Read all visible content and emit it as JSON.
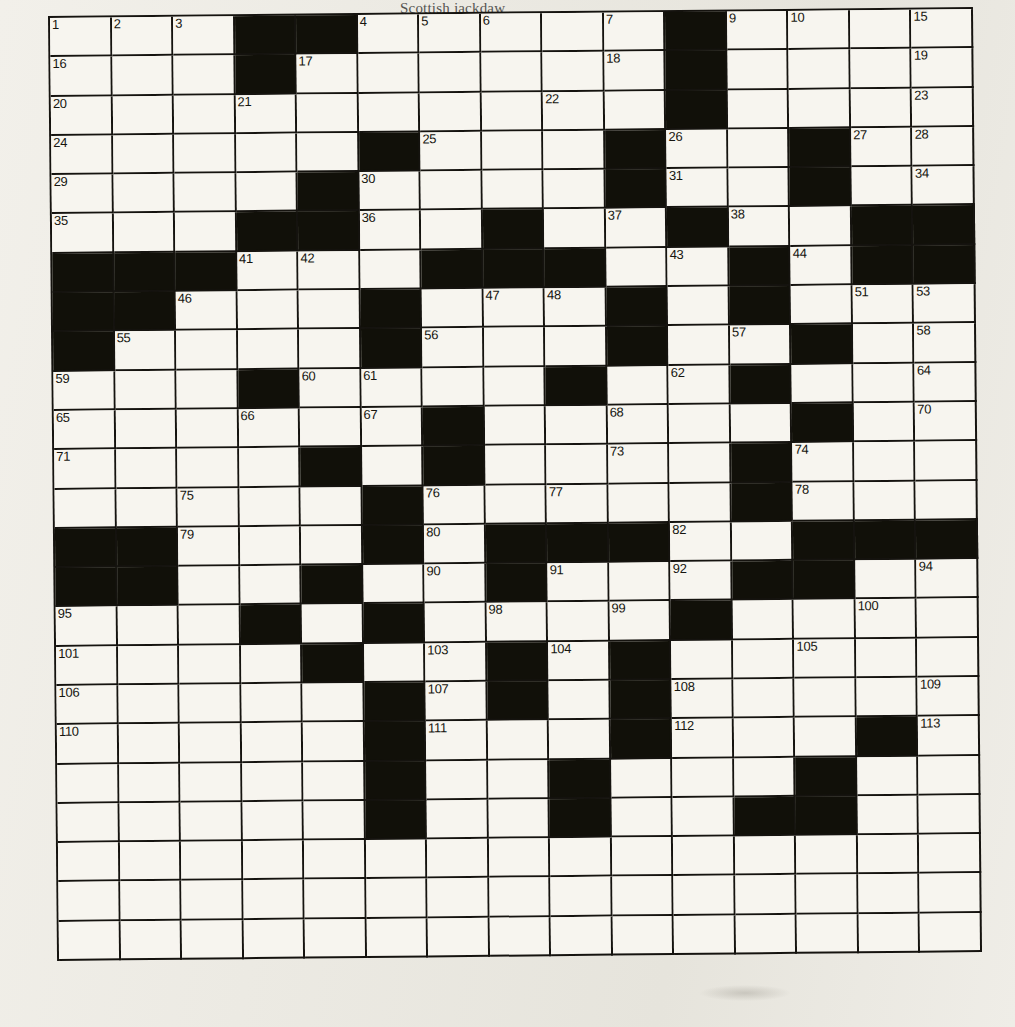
{
  "page": {
    "header_text": "Scottish jackdaw",
    "grid_columns": 15,
    "grid_rows": 24,
    "colors": {
      "paper": "#eceae3",
      "ink": "#15130f",
      "white_cell": "#f7f5ef",
      "black_cell": "#111009"
    }
  },
  "crossword": {
    "title": "Crossword Puzzle Grid",
    "cols": 15,
    "rows": 24,
    "black_cells": [
      [
        0,
        3
      ],
      [
        0,
        4
      ],
      [
        0,
        10
      ],
      [
        1,
        3
      ],
      [
        1,
        10
      ],
      [
        2,
        10
      ],
      [
        3,
        5
      ],
      [
        3,
        9
      ],
      [
        3,
        12
      ],
      [
        4,
        4
      ],
      [
        4,
        9
      ],
      [
        4,
        12
      ],
      [
        5,
        3
      ],
      [
        5,
        4
      ],
      [
        5,
        7
      ],
      [
        5,
        10
      ],
      [
        5,
        13
      ],
      [
        5,
        14
      ],
      [
        6,
        0
      ],
      [
        6,
        1
      ],
      [
        6,
        2
      ],
      [
        6,
        6
      ],
      [
        6,
        7
      ],
      [
        6,
        8
      ],
      [
        6,
        11
      ],
      [
        6,
        13
      ],
      [
        6,
        14
      ],
      [
        7,
        0
      ],
      [
        7,
        1
      ],
      [
        7,
        5
      ],
      [
        7,
        9
      ],
      [
        7,
        11
      ],
      [
        8,
        0
      ],
      [
        8,
        5
      ],
      [
        8,
        9
      ],
      [
        8,
        12
      ],
      [
        9,
        3
      ],
      [
        9,
        8
      ],
      [
        9,
        11
      ],
      [
        10,
        6
      ],
      [
        10,
        12
      ],
      [
        11,
        4
      ],
      [
        11,
        6
      ],
      [
        11,
        11
      ],
      [
        12,
        5
      ],
      [
        12,
        11
      ],
      [
        13,
        0
      ],
      [
        13,
        1
      ],
      [
        13,
        5
      ],
      [
        13,
        7
      ],
      [
        13,
        8
      ],
      [
        13,
        9
      ],
      [
        13,
        12
      ],
      [
        13,
        13
      ],
      [
        13,
        14
      ],
      [
        14,
        0
      ],
      [
        14,
        1
      ],
      [
        14,
        4
      ],
      [
        14,
        7
      ],
      [
        14,
        11
      ],
      [
        14,
        12
      ],
      [
        15,
        3
      ],
      [
        15,
        5
      ],
      [
        15,
        10
      ],
      [
        16,
        4
      ],
      [
        16,
        7
      ],
      [
        16,
        9
      ],
      [
        17,
        5
      ],
      [
        17,
        7
      ],
      [
        17,
        9
      ],
      [
        18,
        5
      ],
      [
        18,
        9
      ],
      [
        18,
        13
      ],
      [
        19,
        5
      ],
      [
        19,
        8
      ],
      [
        19,
        12
      ],
      [
        20,
        5
      ],
      [
        20,
        8
      ],
      [
        20,
        11
      ],
      [
        20,
        12
      ]
    ],
    "numbers": [
      {
        "n": "1",
        "r": 0,
        "c": 0
      },
      {
        "n": "2",
        "r": 0,
        "c": 1
      },
      {
        "n": "3",
        "r": 0,
        "c": 2
      },
      {
        "n": "4",
        "r": 0,
        "c": 5
      },
      {
        "n": "5",
        "r": 0,
        "c": 6
      },
      {
        "n": "6",
        "r": 0,
        "c": 7
      },
      {
        "n": "7",
        "r": 0,
        "c": 9
      },
      {
        "n": "8",
        "r": 0,
        "c": 10
      },
      {
        "n": "9",
        "r": 0,
        "c": 11
      },
      {
        "n": "10",
        "r": 0,
        "c": 12
      },
      {
        "n": "11",
        "r": 0,
        "c": 14
      },
      {
        "n": "12",
        "r": 0,
        "c": 15
      },
      {
        "n": "13",
        "r": 0,
        "c": 16
      },
      {
        "n": "14",
        "r": 0,
        "c": 17
      },
      {
        "n": "15",
        "r": 0,
        "c": 18
      },
      {
        "n": "16",
        "r": 1,
        "c": 0
      },
      {
        "n": "17",
        "r": 1,
        "c": 4
      },
      {
        "n": "18",
        "r": 1,
        "c": 9
      },
      {
        "n": "19",
        "r": 1,
        "c": 14
      },
      {
        "n": "20",
        "r": 2,
        "c": 0
      },
      {
        "n": "21",
        "r": 2,
        "c": 3
      },
      {
        "n": "22",
        "r": 2,
        "c": 8
      },
      {
        "n": "23",
        "r": 2,
        "c": 14
      },
      {
        "n": "24",
        "r": 3,
        "c": 0
      },
      {
        "n": "25",
        "r": 3,
        "c": 6
      },
      {
        "n": "26",
        "r": 3,
        "c": 10
      },
      {
        "n": "27",
        "r": 3,
        "c": 13
      },
      {
        "n": "28",
        "r": 3,
        "c": 15
      },
      {
        "n": "29",
        "r": 4,
        "c": 0
      },
      {
        "n": "30",
        "r": 4,
        "c": 5
      },
      {
        "n": "31",
        "r": 4,
        "c": 10
      },
      {
        "n": "32",
        "r": 4,
        "c": 12
      },
      {
        "n": "33",
        "r": 4,
        "c": 14
      },
      {
        "n": "34",
        "r": 4,
        "c": 16
      },
      {
        "n": "35",
        "r": 5,
        "c": 0
      },
      {
        "n": "36",
        "r": 5,
        "c": 5
      },
      {
        "n": "37",
        "r": 5,
        "c": 9
      },
      {
        "n": "38",
        "r": 5,
        "c": 11
      },
      {
        "n": "39",
        "r": 5,
        "c": 13
      },
      {
        "n": "40",
        "r": 5,
        "c": 15
      },
      {
        "n": "41",
        "r": 6,
        "c": 3
      },
      {
        "n": "42",
        "r": 6,
        "c": 4
      },
      {
        "n": "43",
        "r": 6,
        "c": 10
      },
      {
        "n": "44",
        "r": 6,
        "c": 12
      },
      {
        "n": "45",
        "r": 6,
        "c": 14
      },
      {
        "n": "46",
        "r": 7,
        "c": 2
      },
      {
        "n": "47",
        "r": 7,
        "c": 7
      },
      {
        "n": "48",
        "r": 7,
        "c": 8
      },
      {
        "n": "49",
        "r": 7,
        "c": 9
      },
      {
        "n": "50",
        "r": 7,
        "c": 11
      },
      {
        "n": "51",
        "r": 7,
        "c": 13
      },
      {
        "n": "52",
        "r": 7,
        "c": 17
      },
      {
        "n": "53",
        "r": 7,
        "c": 18
      },
      {
        "n": "54",
        "r": 8,
        "c": 0
      },
      {
        "n": "55",
        "r": 8,
        "c": 1
      },
      {
        "n": "56",
        "r": 8,
        "c": 6
      },
      {
        "n": "57",
        "r": 8,
        "c": 11
      },
      {
        "n": "58",
        "r": 8,
        "c": 15
      },
      {
        "n": "59",
        "r": 9,
        "c": 0
      },
      {
        "n": "60",
        "r": 9,
        "c": 4
      },
      {
        "n": "61",
        "r": 9,
        "c": 5
      },
      {
        "n": "62",
        "r": 9,
        "c": 10
      },
      {
        "n": "63",
        "r": 9,
        "c": 14
      },
      {
        "n": "64",
        "r": 9,
        "c": 16
      },
      {
        "n": "65",
        "r": 10,
        "c": 0
      },
      {
        "n": "66",
        "r": 10,
        "c": 3
      },
      {
        "n": "67",
        "r": 10,
        "c": 5
      },
      {
        "n": "68",
        "r": 10,
        "c": 9
      },
      {
        "n": "69",
        "r": 10,
        "c": 14
      },
      {
        "n": "70",
        "r": 10,
        "c": 15
      },
      {
        "n": "71",
        "r": 11,
        "c": 0
      },
      {
        "n": "72",
        "r": 11,
        "c": 4
      },
      {
        "n": "73",
        "r": 11,
        "c": 9
      },
      {
        "n": "74",
        "r": 11,
        "c": 12
      },
      {
        "n": "75",
        "r": 12,
        "c": 2
      },
      {
        "n": "76",
        "r": 12,
        "c": 6
      },
      {
        "n": "77",
        "r": 12,
        "c": 8
      },
      {
        "n": "78",
        "r": 12,
        "c": 12
      },
      {
        "n": "79",
        "r": 13,
        "c": 2
      },
      {
        "n": "80",
        "r": 13,
        "c": 6
      },
      {
        "n": "81",
        "r": 13,
        "c": 8
      },
      {
        "n": "82",
        "r": 13,
        "c": 10
      },
      {
        "n": "83",
        "r": 13,
        "c": 12
      },
      {
        "n": "84",
        "r": 13,
        "c": 16
      },
      {
        "n": "85",
        "r": 13,
        "c": 17
      },
      {
        "n": "86",
        "r": 13,
        "c": 18
      },
      {
        "n": "87",
        "r": 14,
        "c": 0
      },
      {
        "n": "88",
        "r": 14,
        "c": 1
      },
      {
        "n": "89",
        "r": 14,
        "c": 4
      },
      {
        "n": "90",
        "r": 14,
        "c": 6
      },
      {
        "n": "91",
        "r": 14,
        "c": 8
      },
      {
        "n": "92",
        "r": 14,
        "c": 10
      },
      {
        "n": "93",
        "r": 14,
        "c": 14
      },
      {
        "n": "94",
        "r": 14,
        "c": 15
      },
      {
        "n": "95",
        "r": 15,
        "c": 0
      },
      {
        "n": "96",
        "r": 15,
        "c": 3
      },
      {
        "n": "97",
        "r": 15,
        "c": 5
      },
      {
        "n": "98",
        "r": 15,
        "c": 7
      },
      {
        "n": "99",
        "r": 15,
        "c": 9
      },
      {
        "n": "100",
        "r": 15,
        "c": 13
      },
      {
        "n": "101",
        "r": 16,
        "c": 0
      },
      {
        "n": "102",
        "r": 16,
        "c": 4
      },
      {
        "n": "103",
        "r": 16,
        "c": 6
      },
      {
        "n": "104",
        "r": 16,
        "c": 8
      },
      {
        "n": "105",
        "r": 16,
        "c": 12
      },
      {
        "n": "106",
        "r": 17,
        "c": 0
      },
      {
        "n": "107",
        "r": 17,
        "c": 6
      },
      {
        "n": "108",
        "r": 17,
        "c": 10
      },
      {
        "n": "109",
        "r": 17,
        "c": 15
      },
      {
        "n": "110",
        "r": 18,
        "c": 0
      },
      {
        "n": "111",
        "r": 18,
        "c": 6
      },
      {
        "n": "112",
        "r": 18,
        "c": 10
      },
      {
        "n": "113",
        "r": 18,
        "c": 14
      }
    ]
  }
}
